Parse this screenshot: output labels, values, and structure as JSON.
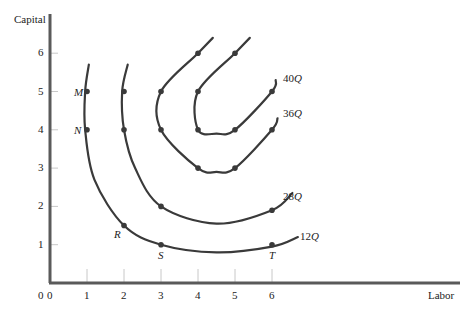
{
  "chart_data": {
    "type": "line",
    "title": "",
    "xlabel": "Labor",
    "ylabel": "Capital",
    "xlim": [
      0,
      7.5
    ],
    "ylim": [
      0,
      6.7
    ],
    "x_ticks": [
      "0",
      "1",
      "2",
      "3",
      "4",
      "5",
      "6"
    ],
    "y_ticks": [
      "1",
      "2",
      "3",
      "4",
      "5",
      "6"
    ],
    "grid": false,
    "series": [
      {
        "name": "12Q",
        "label": "12Q",
        "curve": [
          [
            1.05,
            5.7
          ],
          [
            0.95,
            5
          ],
          [
            0.95,
            4
          ],
          [
            1.2,
            2.7
          ],
          [
            2,
            1.5
          ],
          [
            3,
            1.0
          ],
          [
            4.5,
            0.8
          ],
          [
            6,
            0.95
          ],
          [
            6.7,
            1.2
          ]
        ],
        "points": [
          [
            1,
            5
          ],
          [
            1,
            4
          ],
          [
            2,
            1.5
          ],
          [
            3,
            1
          ],
          [
            6,
            1
          ]
        ]
      },
      {
        "name": "28Q",
        "label": "28Q",
        "curve": [
          [
            2.1,
            5.7
          ],
          [
            1.95,
            5
          ],
          [
            2,
            4
          ],
          [
            2.3,
            3
          ],
          [
            3,
            2
          ],
          [
            4.5,
            1.55
          ],
          [
            6,
            1.9
          ],
          [
            6.55,
            2.35
          ]
        ],
        "points": [
          [
            2,
            5
          ],
          [
            2,
            4
          ],
          [
            3,
            2
          ],
          [
            6,
            1.9
          ]
        ]
      },
      {
        "name": "36Q",
        "label": "36Q",
        "curve": [
          [
            4.4,
            6.4
          ],
          [
            4,
            6
          ],
          [
            3,
            5
          ],
          [
            3,
            4
          ],
          [
            4,
            3
          ],
          [
            4.5,
            2.9
          ],
          [
            5,
            3
          ],
          [
            6,
            4
          ],
          [
            6.15,
            4.3
          ]
        ],
        "points": [
          [
            4,
            6
          ],
          [
            3,
            5
          ],
          [
            3,
            4
          ],
          [
            4,
            3
          ],
          [
            5,
            3
          ],
          [
            6,
            4
          ]
        ]
      },
      {
        "name": "40Q",
        "label": "40Q",
        "curve": [
          [
            5.4,
            6.4
          ],
          [
            5,
            6
          ],
          [
            4,
            5
          ],
          [
            4,
            4
          ],
          [
            4.5,
            3.9
          ],
          [
            5,
            4
          ],
          [
            6,
            5
          ],
          [
            6.1,
            5.3
          ]
        ],
        "points": [
          [
            5,
            6
          ],
          [
            4,
            5
          ],
          [
            4,
            4
          ],
          [
            5,
            4
          ],
          [
            6,
            5
          ]
        ]
      }
    ],
    "annotations": [
      {
        "text": "M",
        "at": [
          1,
          5
        ]
      },
      {
        "text": "N",
        "at": [
          1,
          4
        ]
      },
      {
        "text": "R",
        "at": [
          2,
          1.5
        ]
      },
      {
        "text": "S",
        "at": [
          3,
          1
        ]
      },
      {
        "text": "T",
        "at": [
          6,
          1
        ]
      }
    ]
  },
  "axes": {
    "x_label": "Labor",
    "y_label": "Capital",
    "origin": "0"
  },
  "colors": {
    "curve": "#3a3a3a",
    "axis": "#5a5a5a",
    "tick": "#c8c8c8",
    "text": "#222222"
  }
}
